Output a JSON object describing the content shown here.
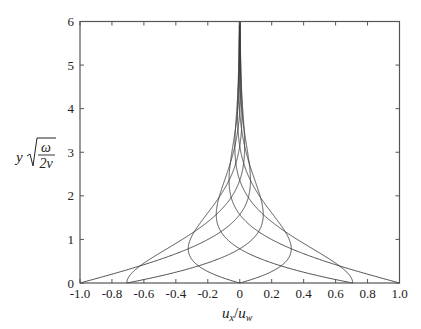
{
  "chart_data": {
    "type": "line",
    "title": "",
    "xlabel": "u_x / u_w",
    "ylabel": "y √(ω / 2ν)",
    "xlim": [
      -1.0,
      1.0
    ],
    "ylim": [
      0,
      6
    ],
    "xticks": [
      "-1.0",
      "-0.8",
      "-0.6",
      "-0.4",
      "-0.2",
      "0",
      "0.2",
      "0.4",
      "0.6",
      "0.8",
      "1.0"
    ],
    "yticks": [
      "0",
      "1",
      "2",
      "3",
      "4",
      "5",
      "6"
    ],
    "grid": false,
    "legend": null,
    "series": [
      {
        "name": "phase 0",
        "phase_deg": 0,
        "u_at_wall": 1.0
      },
      {
        "name": "phase 45",
        "phase_deg": 45,
        "u_at_wall": 0.707
      },
      {
        "name": "phase 90",
        "phase_deg": 90,
        "u_at_wall": 0.0
      },
      {
        "name": "phase 135",
        "phase_deg": 135,
        "u_at_wall": -0.707
      },
      {
        "name": "phase 180",
        "phase_deg": 180,
        "u_at_wall": -1.0
      },
      {
        "name": "phase 225",
        "phase_deg": 225,
        "u_at_wall": -0.707
      },
      {
        "name": "phase 270",
        "phase_deg": 270,
        "u_at_wall": 0.0
      },
      {
        "name": "phase 315",
        "phase_deg": 315,
        "u_at_wall": 0.707
      }
    ]
  },
  "labels": {
    "x_main": "u",
    "x_sub": "x",
    "x_slash": "/",
    "x_main2": "u",
    "x_sub2": "w",
    "y_var": "y",
    "y_num": "ω",
    "y_den": "2ν"
  },
  "colors": {
    "axis": "#555555",
    "curve": "#3a3a3a",
    "text": "#222222"
  }
}
